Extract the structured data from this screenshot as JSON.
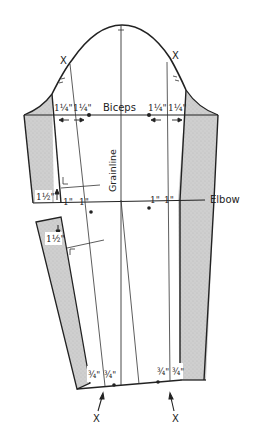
{
  "diagram": {
    "labels": {
      "biceps": "Biceps",
      "grainline": "Grainline",
      "elbow": "Elbow",
      "notch_left_top": "X",
      "notch_right_top": "X",
      "notch_left_bottom": "X",
      "notch_right_bottom": "X"
    },
    "measurements": {
      "biceps_left_outer": "1¼\"",
      "biceps_left_inner": "1¼\"",
      "biceps_right_inner": "1¼\"",
      "biceps_right_outer": "1¼\"",
      "elbow_left_outer": "1\"",
      "elbow_left_inner": "1\"",
      "elbow_right_inner": "1\"",
      "elbow_right_outer": "1\"",
      "side_upper": "1½\"",
      "side_lower": "1½\"",
      "wrist_left_outer": "¾\"",
      "wrist_left_inner": "¾\"",
      "wrist_right_inner": "¾\"",
      "wrist_right_outer": "¾\""
    },
    "colors": {
      "line": "#222222",
      "shade": "#c9c9c9",
      "background": "#ffffff"
    }
  }
}
